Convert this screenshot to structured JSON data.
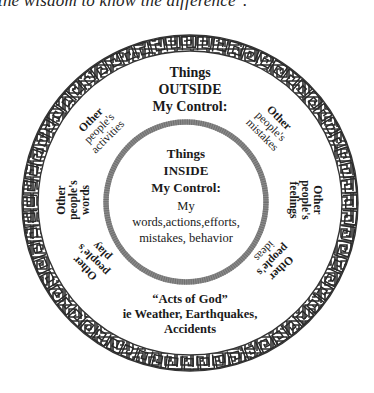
{
  "header": {
    "quote_fragment": "the wisdom to know the difference\"."
  },
  "diagram": {
    "colors": {
      "ink": "#1a1a1a",
      "ring": "#333333",
      "inner_ring": "#8a8a8a",
      "background": "#ffffff"
    },
    "outer_ring": {
      "pattern": "greek-key meander border"
    },
    "outer_title": {
      "line1": "Things",
      "line2": "OUTSIDE",
      "line3": "My Control:"
    },
    "inner_title": {
      "line1": "Things",
      "line2": "INSIDE",
      "line3": "My Control:"
    },
    "inner_body": {
      "line1": "My",
      "line2": "words,actions,efforts,",
      "line3": "mistakes, behavior"
    },
    "spokes": [
      {
        "id": "activities",
        "line1": "Other",
        "line2": "people's",
        "line3": "activities"
      },
      {
        "id": "mistakes",
        "line1": "Other",
        "line2": "people's",
        "line3": "mistakes"
      },
      {
        "id": "feelings",
        "line1": "Other",
        "line2": "people's",
        "line3": "feelings"
      },
      {
        "id": "ideas",
        "line1": "Other",
        "line2": "people's",
        "line3": "ideas"
      },
      {
        "id": "play",
        "line1": "Other",
        "line2": "people's",
        "line3": "play"
      },
      {
        "id": "words",
        "line1": "Other",
        "line2": "people's",
        "line3": "words"
      }
    ],
    "bottom": {
      "line1": "“Acts of God”",
      "line2": "ie Weather, Earthquakes,",
      "line3": "Accidents"
    }
  }
}
